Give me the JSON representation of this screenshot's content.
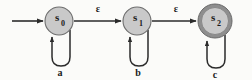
{
  "diagram": {
    "type": "finite-state-automaton",
    "background_color": "#fbfbf9",
    "state_fill_color": "#c9c9c9",
    "state_stroke_color": "#6d6d6d",
    "accept_ring_color": "#8e8e8e",
    "edge_color": "#2b2b2b",
    "states": [
      {
        "id": "s0",
        "base_label": "s",
        "subscript": "0",
        "cx": 59,
        "cy": 21,
        "r": 14,
        "accepting": false,
        "is_start": true
      },
      {
        "id": "s1",
        "base_label": "s",
        "subscript": "1",
        "cx": 137,
        "cy": 21,
        "r": 14,
        "accepting": false,
        "is_start": false
      },
      {
        "id": "s2",
        "base_label": "s",
        "subscript": "2",
        "cx": 215,
        "cy": 21,
        "r": 17,
        "accepting": true,
        "is_start": false
      }
    ],
    "start_arrow": {
      "label": "",
      "from_x": 12,
      "to_x": 44,
      "y": 21
    },
    "transitions": [
      {
        "id": "s0-to-s1",
        "from": "s0",
        "to": "s1",
        "label": "ε",
        "label_x": 98,
        "label_y": 13
      },
      {
        "id": "s1-to-s2",
        "from": "s1",
        "to": "s2",
        "label": "ε",
        "label_x": 176,
        "label_y": 13
      }
    ],
    "self_loops": [
      {
        "id": "loop-s0",
        "state": "s0",
        "label": "a",
        "label_x": 59,
        "label_y": 75
      },
      {
        "id": "loop-s1",
        "state": "s1",
        "label": "b",
        "label_x": 137,
        "label_y": 75
      },
      {
        "id": "loop-s2",
        "state": "s2",
        "label": "c",
        "label_x": 215,
        "label_y": 77
      }
    ]
  }
}
